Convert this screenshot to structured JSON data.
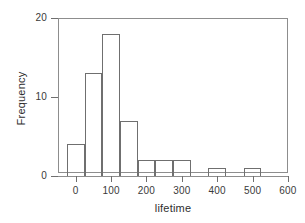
{
  "chart_data": {
    "type": "bar",
    "title": "",
    "subtitle": "",
    "xlabel": "lifetime",
    "ylabel": "Frequency",
    "xlim": [
      -50,
      600
    ],
    "ylim": [
      0,
      20
    ],
    "grid": false,
    "legend": null,
    "bin_width": 50,
    "bin_edges": [
      -25,
      25,
      75,
      125,
      175,
      225,
      275,
      325,
      375,
      425,
      475,
      525
    ],
    "categories": [
      "-25 to 25",
      "25 to 75",
      "75 to 125",
      "125 to 175",
      "175 to 225",
      "225 to 275",
      "275 to 325",
      "325 to 375",
      "375 to 425",
      "425 to 475",
      "475 to 525"
    ],
    "values": [
      4,
      13,
      18,
      7,
      2,
      2,
      2,
      0,
      1,
      0,
      1
    ],
    "x_ticks": [
      {
        "value": 0,
        "label": "0"
      },
      {
        "value": 100,
        "label": "100"
      },
      {
        "value": 200,
        "label": "200"
      },
      {
        "value": 300,
        "label": "300"
      },
      {
        "value": 400,
        "label": "400"
      },
      {
        "value": 500,
        "label": "500"
      },
      {
        "value": 600,
        "label": "600"
      }
    ],
    "y_ticks": [
      {
        "value": 0,
        "label": "0"
      },
      {
        "value": 10,
        "label": "10"
      },
      {
        "value": 20,
        "label": "20"
      }
    ]
  },
  "colors": {
    "bar_stroke": "#6f6f6f",
    "bar_fill": "transparent",
    "axis": "#8d8d8d",
    "text": "#3a3a3a",
    "background": "#ffffff"
  }
}
